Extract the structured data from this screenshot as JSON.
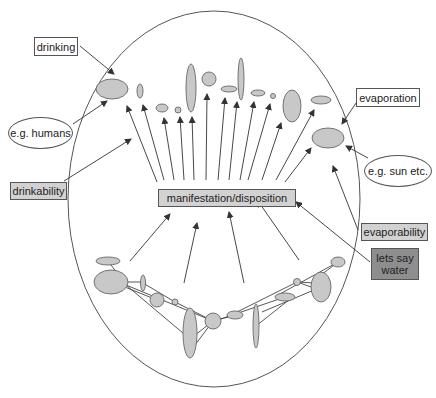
{
  "diagram": {
    "type": "conceptual-diagram",
    "colors": {
      "line": "#444444",
      "blob_fill": "#c8c8c8",
      "blob_stroke": "#666666",
      "grey_box": "#d2d2d2",
      "dark_box": "#8e8e8e"
    },
    "center_label": "manifestation/disposition",
    "labels": {
      "drinking": "drinking",
      "humans": "e.g. humans",
      "drinkability": "drinkability",
      "evaporation": "evaporation",
      "sun": "e.g. sun etc.",
      "evaporability": "evaporability",
      "water_line1": "lets say",
      "water_line2": "water"
    },
    "outer_ellipse": {
      "cx": 214,
      "cy": 199,
      "rx": 146,
      "ry": 188
    },
    "top_blobs": [
      {
        "cx": 112,
        "cy": 89,
        "rx": 16,
        "ry": 10
      },
      {
        "cx": 140,
        "cy": 91,
        "rx": 3,
        "ry": 7
      },
      {
        "cx": 162,
        "cy": 108,
        "rx": 6,
        "ry": 4
      },
      {
        "cx": 178,
        "cy": 110,
        "rx": 3,
        "ry": 3
      },
      {
        "cx": 191,
        "cy": 88,
        "rx": 5,
        "ry": 24
      },
      {
        "cx": 209,
        "cy": 79,
        "rx": 7,
        "ry": 7
      },
      {
        "cx": 229,
        "cy": 89,
        "rx": 8,
        "ry": 3
      },
      {
        "cx": 241,
        "cy": 79,
        "rx": 3,
        "ry": 21
      },
      {
        "cx": 258,
        "cy": 93,
        "rx": 7,
        "ry": 3
      },
      {
        "cx": 273,
        "cy": 96,
        "rx": 2.5,
        "ry": 2.5
      },
      {
        "cx": 292,
        "cy": 106,
        "rx": 9,
        "ry": 16
      },
      {
        "cx": 321,
        "cy": 100,
        "rx": 10,
        "ry": 4
      },
      {
        "cx": 328,
        "cy": 138,
        "rx": 16,
        "ry": 10
      }
    ],
    "fan_arrows": [
      {
        "x1": 157,
        "y1": 182,
        "x2": 127,
        "y2": 106
      },
      {
        "x1": 164,
        "y1": 180,
        "x2": 143,
        "y2": 105
      },
      {
        "x1": 174,
        "y1": 180,
        "x2": 164,
        "y2": 118
      },
      {
        "x1": 184,
        "y1": 180,
        "x2": 180,
        "y2": 117
      },
      {
        "x1": 194,
        "y1": 180,
        "x2": 192,
        "y2": 117
      },
      {
        "x1": 206,
        "y1": 180,
        "x2": 207,
        "y2": 94
      },
      {
        "x1": 218,
        "y1": 180,
        "x2": 225,
        "y2": 98
      },
      {
        "x1": 229,
        "y1": 180,
        "x2": 237,
        "y2": 102
      },
      {
        "x1": 240,
        "y1": 180,
        "x2": 254,
        "y2": 102
      },
      {
        "x1": 248,
        "y1": 180,
        "x2": 270,
        "y2": 104
      },
      {
        "x1": 262,
        "y1": 180,
        "x2": 281,
        "y2": 123
      },
      {
        "x1": 276,
        "y1": 180,
        "x2": 314,
        "y2": 110
      },
      {
        "x1": 285,
        "y1": 182,
        "x2": 311,
        "y2": 148
      }
    ],
    "bottom_arrows": [
      {
        "x1": 130,
        "y1": 261,
        "x2": 170,
        "y2": 214
      },
      {
        "x1": 184,
        "y1": 283,
        "x2": 197,
        "y2": 223
      },
      {
        "x1": 244,
        "y1": 283,
        "x2": 229,
        "y2": 212
      },
      {
        "x1": 299,
        "y1": 260,
        "x2": 258,
        "y2": 201
      }
    ],
    "label_arrows": [
      {
        "from": "drinking",
        "x1": 80,
        "y1": 46,
        "x2": 114,
        "y2": 74
      },
      {
        "from": "humans",
        "x1": 73,
        "y1": 124,
        "x2": 107,
        "y2": 101
      },
      {
        "from": "drinkability",
        "x1": 64,
        "y1": 181,
        "x2": 131,
        "y2": 139
      },
      {
        "from": "evaporation",
        "x1": 356,
        "y1": 103,
        "x2": 342,
        "y2": 124
      },
      {
        "from": "sun",
        "x1": 368,
        "y1": 158,
        "x2": 346,
        "y2": 146
      },
      {
        "from": "evaporability",
        "x1": 358,
        "y1": 230,
        "x2": 333,
        "y2": 166
      },
      {
        "from": "water",
        "x1": 370,
        "y1": 262,
        "x2": 296,
        "y2": 202
      }
    ],
    "bottom_blobs": [
      {
        "cx": 108,
        "cy": 261,
        "rx": 12,
        "ry": 4
      },
      {
        "cx": 111,
        "cy": 282,
        "rx": 17,
        "ry": 12
      },
      {
        "cx": 143,
        "cy": 283,
        "rx": 2.5,
        "ry": 8
      },
      {
        "cx": 157,
        "cy": 300,
        "rx": 7,
        "ry": 7
      },
      {
        "cx": 175,
        "cy": 302,
        "rx": 3,
        "ry": 3
      },
      {
        "cx": 190,
        "cy": 333,
        "rx": 7,
        "ry": 25
      },
      {
        "cx": 213,
        "cy": 321,
        "rx": 8,
        "ry": 8
      },
      {
        "cx": 235,
        "cy": 315,
        "rx": 8,
        "ry": 4
      },
      {
        "cx": 256,
        "cy": 326,
        "rx": 3,
        "ry": 22
      },
      {
        "cx": 285,
        "cy": 297,
        "rx": 10,
        "ry": 4
      },
      {
        "cx": 297,
        "cy": 282,
        "rx": 3.5,
        "ry": 3.5
      },
      {
        "cx": 321,
        "cy": 287,
        "rx": 10,
        "ry": 15
      },
      {
        "cx": 338,
        "cy": 262,
        "rx": 7,
        "ry": 5
      }
    ],
    "network_lines": [
      {
        "x1": 108,
        "y1": 261,
        "x2": 126,
        "y2": 285
      },
      {
        "x1": 111,
        "y1": 282,
        "x2": 143,
        "y2": 282
      },
      {
        "x1": 120,
        "y1": 285,
        "x2": 157,
        "y2": 300
      },
      {
        "x1": 126,
        "y1": 285,
        "x2": 190,
        "y2": 339
      },
      {
        "x1": 126,
        "y1": 285,
        "x2": 213,
        "y2": 321
      },
      {
        "x1": 143,
        "y1": 283,
        "x2": 175,
        "y2": 302
      },
      {
        "x1": 175,
        "y1": 302,
        "x2": 213,
        "y2": 321
      },
      {
        "x1": 190,
        "y1": 339,
        "x2": 213,
        "y2": 321
      },
      {
        "x1": 195,
        "y1": 345,
        "x2": 213,
        "y2": 321
      },
      {
        "x1": 213,
        "y1": 321,
        "x2": 235,
        "y2": 315
      },
      {
        "x1": 218,
        "y1": 320,
        "x2": 285,
        "y2": 297
      },
      {
        "x1": 225,
        "y1": 318,
        "x2": 297,
        "y2": 282
      },
      {
        "x1": 256,
        "y1": 326,
        "x2": 290,
        "y2": 299
      },
      {
        "x1": 262,
        "y1": 312,
        "x2": 321,
        "y2": 287
      },
      {
        "x1": 278,
        "y1": 295,
        "x2": 338,
        "y2": 262
      },
      {
        "x1": 297,
        "y1": 282,
        "x2": 314,
        "y2": 283
      },
      {
        "x1": 297,
        "y1": 282,
        "x2": 314,
        "y2": 288
      },
      {
        "x1": 321,
        "y1": 275,
        "x2": 338,
        "y2": 262
      }
    ]
  }
}
